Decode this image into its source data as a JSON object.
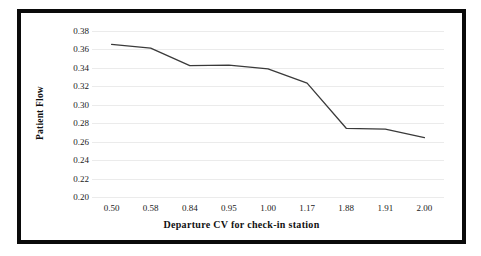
{
  "chart_data": {
    "type": "line",
    "title": "",
    "xlabel": "Departure CV for check-in station",
    "ylabel": "Patient Flow",
    "categories": [
      "0.50",
      "0.58",
      "0.84",
      "0.95",
      "1.00",
      "1.17",
      "1.88",
      "1.91",
      "2.00"
    ],
    "values": [
      0.3655,
      0.3615,
      0.3425,
      0.343,
      0.339,
      0.3235,
      0.2745,
      0.2735,
      0.2645
    ],
    "series": [
      {
        "name": "Patient Flow",
        "values": [
          0.3655,
          0.3615,
          0.3425,
          0.343,
          0.339,
          0.3235,
          0.2745,
          0.2735,
          0.2645
        ]
      }
    ],
    "ylim": [
      0.2,
      0.38
    ],
    "ytick_step": 0.02,
    "ytick_labels": [
      "0.38",
      "0.36",
      "0.34",
      "0.32",
      "0.30",
      "0.28",
      "0.26",
      "0.24",
      "0.22",
      "0.20"
    ],
    "ytick_values": [
      0.38,
      0.36,
      0.34,
      0.32,
      0.3,
      0.28,
      0.26,
      0.24,
      0.22,
      0.2
    ],
    "grid": true,
    "grid_axis": "y",
    "legend": false,
    "legend_position": "none",
    "markers": false,
    "line_color": "#3a3a3a",
    "grid_color": "#ebebeb",
    "border_color": "#0a0a0a",
    "background_color": "#ffffff"
  }
}
